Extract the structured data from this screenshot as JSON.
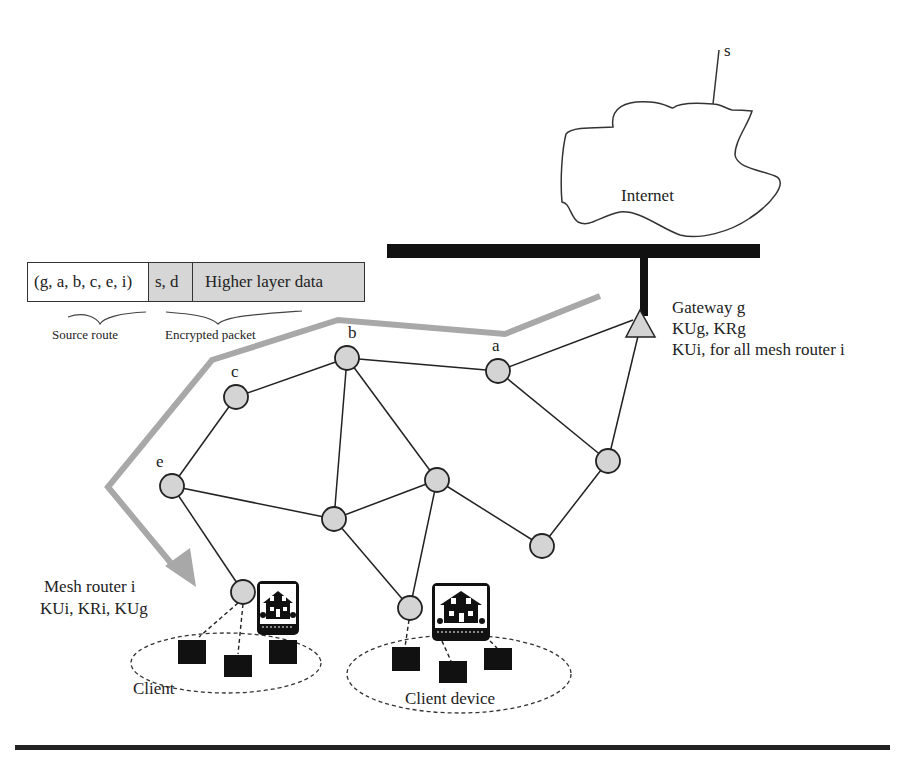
{
  "packet": {
    "source_route": "(g, a, b, c, e, i)",
    "addresses": "s, d",
    "payload": "Higher layer data",
    "source_route_caption": "Source route",
    "encrypted_caption": "Encrypted packet"
  },
  "internet": {
    "label": "Internet",
    "source_label": "s"
  },
  "gateway": {
    "line1": "Gateway g",
    "line2": "KUg, KRg",
    "line3": "KUi, for all mesh router i"
  },
  "nodes": {
    "a": "a",
    "b": "b",
    "c": "c",
    "e": "e"
  },
  "mesh_router": {
    "line1": "Mesh router i",
    "line2": "KUi, KRi, KUg"
  },
  "clients": {
    "left_label": "Client",
    "right_label": "Client device"
  },
  "colors": {
    "node_fill": "#d4d4d4",
    "route_path": "#a8a8a8",
    "bus": "#111111"
  }
}
